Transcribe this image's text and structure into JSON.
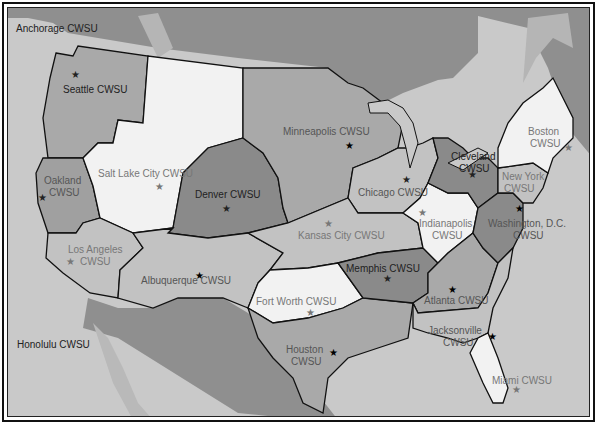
{
  "map": {
    "title": "CWSU Areas of Responsibility",
    "colors": {
      "ocean": "#c9c9c9",
      "canada": "#8f8f8f",
      "mexico": "#8f8f8f",
      "zone_dark": "#8a8a8a",
      "zone_mid": "#a9a9a9",
      "zone_light": "#c2c2c2",
      "zone_white": "#f2f2f2",
      "border": "#111111"
    },
    "offshore_labels": {
      "anchorage": "Anchorage CWSU",
      "honolulu": "Honolulu CWSU"
    },
    "zones": [
      {
        "id": "seattle",
        "line1": "Seattle CWSU",
        "line2": ""
      },
      {
        "id": "oakland",
        "line1": "Oakland",
        "line2": "CWSU"
      },
      {
        "id": "salt-lake-city",
        "line1": "Salt Lake City CWSU",
        "line2": ""
      },
      {
        "id": "los-angeles",
        "line1": "Los Angeles",
        "line2": "CWSU"
      },
      {
        "id": "denver",
        "line1": "Denver CWSU",
        "line2": ""
      },
      {
        "id": "albuquerque",
        "line1": "Albuquerque CWSU",
        "line2": ""
      },
      {
        "id": "minneapolis",
        "line1": "Minneapolis CWSU",
        "line2": ""
      },
      {
        "id": "kansas-city",
        "line1": "Kansas City CWSU",
        "line2": ""
      },
      {
        "id": "fort-worth",
        "line1": "Fort Worth CWSU",
        "line2": ""
      },
      {
        "id": "houston",
        "line1": "Houston",
        "line2": "CWSU"
      },
      {
        "id": "chicago",
        "line1": "Chicago CWSU",
        "line2": ""
      },
      {
        "id": "memphis",
        "line1": "Memphis CWSU",
        "line2": ""
      },
      {
        "id": "indianapolis",
        "line1": "Indianapolis",
        "line2": "CWSU"
      },
      {
        "id": "cleveland",
        "line1": "Cleveland",
        "line2": "CWSU"
      },
      {
        "id": "atlanta",
        "line1": "Atlanta CWSU",
        "line2": ""
      },
      {
        "id": "jacksonville",
        "line1": "Jacksonville",
        "line2": "CWSU"
      },
      {
        "id": "miami",
        "line1": "Miami CWSU",
        "line2": ""
      },
      {
        "id": "washington-dc",
        "line1": "Washington, D.C.",
        "line2": "CWSU"
      },
      {
        "id": "new-york",
        "line1": "New York",
        "line2": "CWSU"
      },
      {
        "id": "boston",
        "line1": "Boston",
        "line2": "CWSU"
      }
    ],
    "star_symbol": "★"
  }
}
